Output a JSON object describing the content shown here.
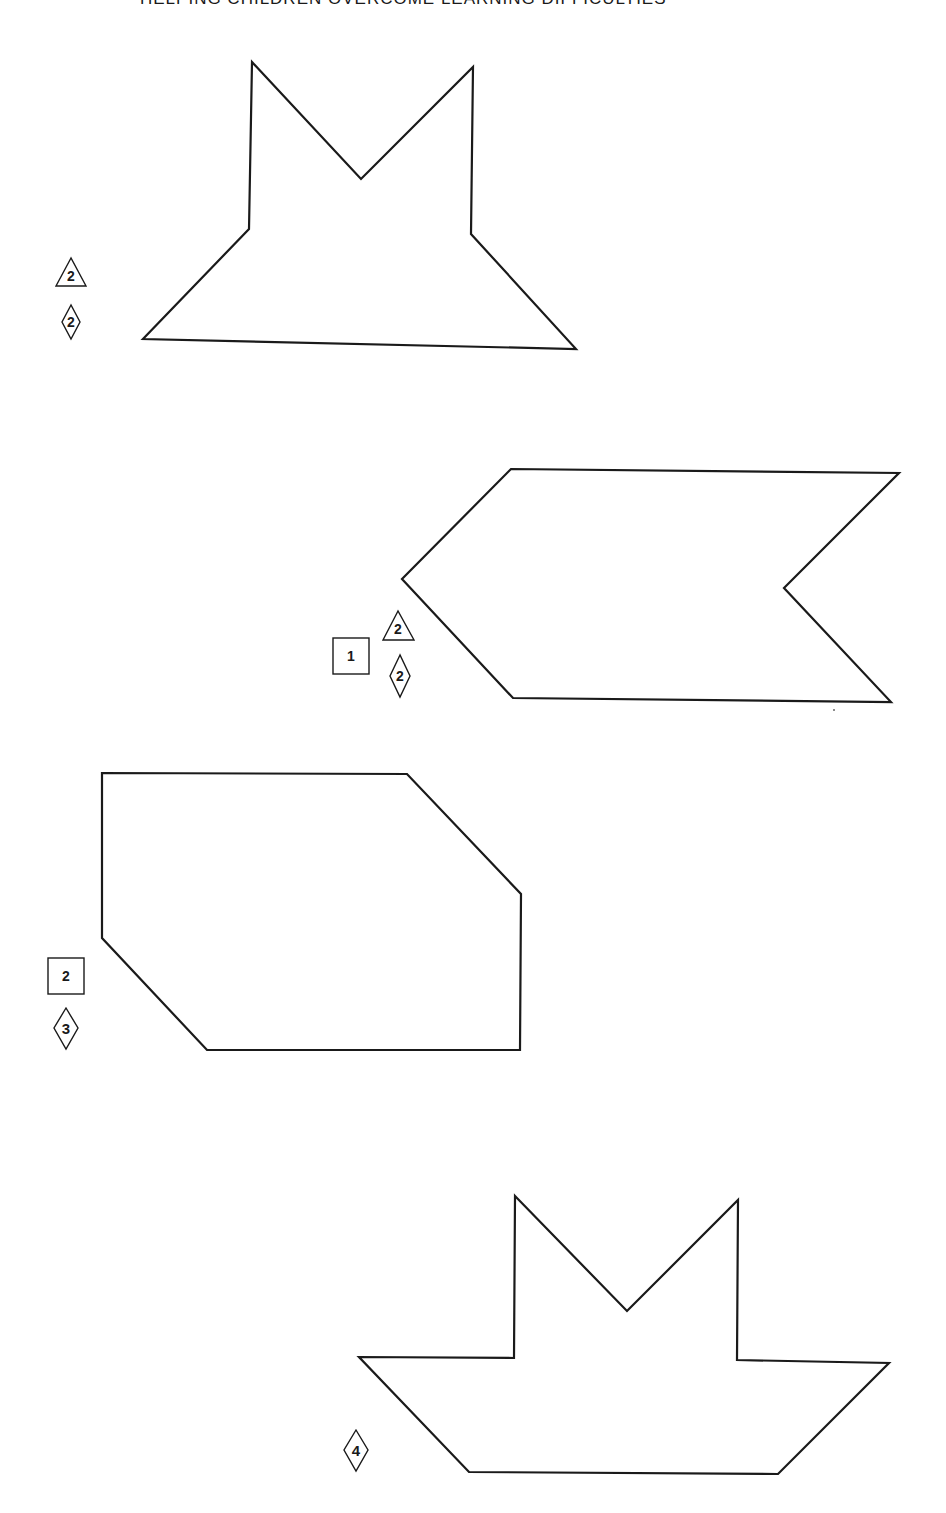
{
  "page": {
    "header": "HELPING CHILDREN OVERCOME LEARNING DIFFICULTIES"
  },
  "figures": [
    {
      "id": "figure-1",
      "description": "crown-like outline with two peaks over a trapezoid base",
      "markers": [
        {
          "shape": "triangle",
          "label": "2"
        },
        {
          "shape": "diamond",
          "label": "2"
        }
      ]
    },
    {
      "id": "figure-2",
      "description": "chevron / arrow-tail outline pointing left",
      "markers": [
        {
          "shape": "square",
          "label": "1"
        },
        {
          "shape": "triangle",
          "label": "2"
        },
        {
          "shape": "diamond",
          "label": "2"
        }
      ]
    },
    {
      "id": "figure-3",
      "description": "irregular hexagon with two clipped corners",
      "markers": [
        {
          "shape": "square",
          "label": "2"
        },
        {
          "shape": "diamond",
          "label": "3"
        }
      ]
    },
    {
      "id": "figure-4",
      "description": "boat outline with twin peaks above a trapezoid hull",
      "markers": [
        {
          "shape": "diamond",
          "label": "4"
        }
      ]
    }
  ],
  "colors": {
    "ink": "#1a1a1a",
    "paper": "#ffffff"
  }
}
